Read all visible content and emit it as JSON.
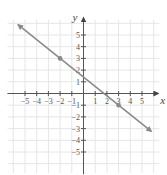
{
  "chart_data": {
    "type": "line",
    "title": "",
    "xlabel": "x",
    "ylabel": "y",
    "xlim": [
      -6,
      6
    ],
    "ylim": [
      -6,
      6
    ],
    "grid": true,
    "x_ticks": [
      -5,
      -4,
      -3,
      -2,
      -1,
      1,
      2,
      3,
      4,
      5
    ],
    "y_ticks": [
      -5,
      -4,
      -3,
      -2,
      -1,
      1,
      2,
      3,
      4,
      5
    ],
    "x_tick_labels": [
      "−5",
      "−4",
      "−3",
      "−2",
      "−1",
      "1",
      "2",
      "3",
      "4",
      "5"
    ],
    "y_tick_labels": [
      "−5",
      "−4",
      "−3",
      "−2",
      "−1",
      "1",
      "2",
      "3",
      "4",
      "5"
    ],
    "series": [
      {
        "name": "line",
        "equation": "y = -4/5 x + 7/5",
        "slope": -0.8,
        "intercept": 1.4,
        "x": [
          -5.6,
          5.8
        ],
        "y": [
          5.88,
          -3.24
        ],
        "arrows": "both",
        "color": "#8a8a8a"
      }
    ],
    "marked_points": [
      {
        "x": -2,
        "y": 3
      },
      {
        "x": 3,
        "y": -1
      }
    ]
  },
  "colors": {
    "line": "#8a8a8a",
    "axis": "#555555",
    "grid": "#e6e6e6"
  }
}
